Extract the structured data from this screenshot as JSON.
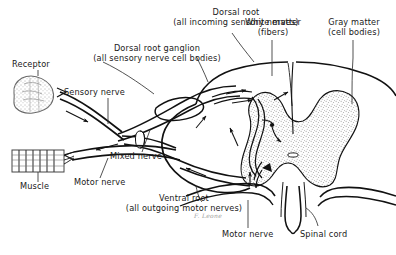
{
  "figure": {
    "background_color": "#ffffff",
    "ink_color": "#111111",
    "gray_matter_fill": "#f2f2f2",
    "stipple_color": "#4a4a4a",
    "signature": "F. Leone"
  },
  "labels": {
    "dorsal_root": {
      "line1": "Dorsal root",
      "line2": "(all incoming sensory nerves)"
    },
    "dorsal_root_ganglion": {
      "line1": "Dorsal root ganglion",
      "line2": "(all sensory nerve cell bodies)"
    },
    "white_matter": {
      "line1": "White matter",
      "line2": "(fibers)"
    },
    "gray_matter": {
      "line1": "Gray matter",
      "line2": "(cell bodies)"
    },
    "ventral_root": {
      "line1": "Ventral root",
      "line2": "(all outgoing motor nerves)"
    },
    "receptor": "Receptor",
    "sensory_nerve": "Sensory nerve",
    "mixed_nerve": "Mixed nerve",
    "motor_nerve_left": "Motor nerve",
    "motor_nerve_bottom": "Motor nerve",
    "muscle": "Muscle",
    "spinal_cord": "Spinal cord"
  }
}
